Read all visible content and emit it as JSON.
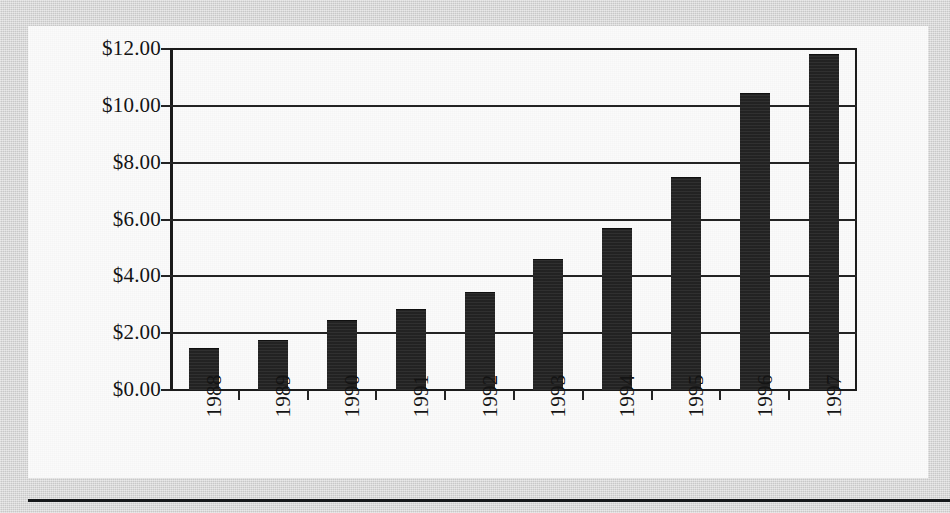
{
  "chart_data": {
    "type": "bar",
    "title": "",
    "subtitle": "",
    "xlabel": "",
    "ylabel": "",
    "categories": [
      "1988",
      "1989",
      "1990",
      "1991",
      "1992",
      "1993",
      "1994",
      "1995",
      "1996",
      "1997"
    ],
    "values": [
      1.45,
      1.72,
      2.42,
      2.8,
      3.4,
      4.58,
      5.65,
      7.45,
      10.4,
      11.8
    ],
    "value_prefix": "$",
    "ylim": [
      0,
      12
    ],
    "ytick_step": 2,
    "ytick_labels": [
      "$12.00",
      "$10.00",
      "$8.00",
      "$6.00",
      "$4.00",
      "$2.00",
      "$0.00"
    ],
    "ytick_values": [
      12,
      10,
      8,
      6,
      4,
      2,
      0
    ],
    "grid": "horizontal",
    "legend": "none",
    "bar_color": "#272727",
    "axis_color": "#232323",
    "panel_color": "#fbfbfb",
    "page_color": "#d6d6d6",
    "xlabel_rotation": -90
  }
}
